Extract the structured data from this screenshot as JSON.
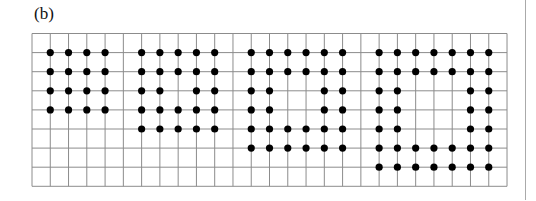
{
  "figure": {
    "label": "(b)",
    "grid": {
      "origin_x": 32,
      "origin_y": 33.5,
      "cols": 26,
      "rows": 8,
      "cell_w": 18.27,
      "cell_h": 19.1,
      "line_color": "#8c8c8c",
      "dot_color": "#000000",
      "dot_radius": 3.6
    },
    "panels": [
      {
        "name": "panel-1-4x4-solid",
        "size": 4,
        "col_start": 1,
        "row_start": 1,
        "hole": 0
      },
      {
        "name": "panel-2-5x5-hole1",
        "size": 5,
        "col_start": 6,
        "row_start": 1,
        "hole": 1
      },
      {
        "name": "panel-3-6x6-hole2",
        "size": 6,
        "col_start": 12,
        "row_start": 1,
        "hole": 2
      },
      {
        "name": "panel-4-7x7-hole3",
        "size": 7,
        "col_start": 19,
        "row_start": 1,
        "hole": 3
      }
    ]
  }
}
